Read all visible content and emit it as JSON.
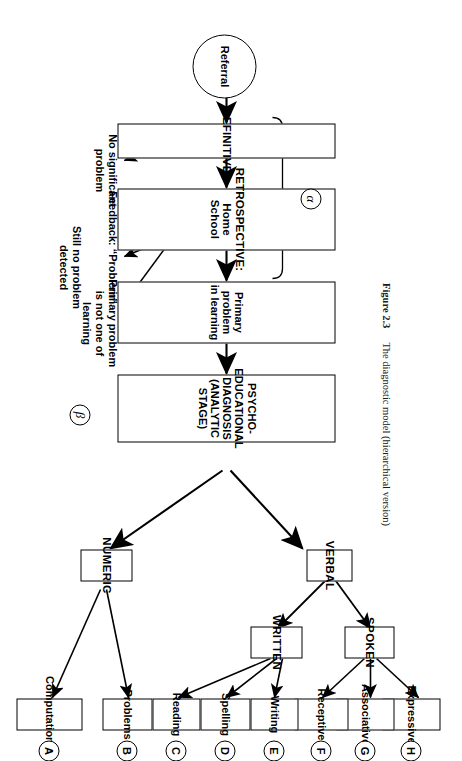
{
  "figure": {
    "caption_label": "Figure 2.3",
    "caption_text": "The diagnostic model (hierarchical version)"
  },
  "start": {
    "label": "Referral"
  },
  "stages": {
    "alpha_marker": "α",
    "beta_marker": "β",
    "boxes": [
      {
        "id": "definitive",
        "label": "DEFINITIVE"
      },
      {
        "id": "retrospective",
        "label": "RETROSPECTIVE: Home\nSchool"
      },
      {
        "id": "primary-problem",
        "label": "Primary problem\nin learning"
      },
      {
        "id": "psycho-educational",
        "label": "PSYCHO-EDUCATIONAL\nDIAGNOSIS (ANALYTIC STAGE)"
      }
    ]
  },
  "notes": [
    {
      "id": "no-significant-problem",
      "text": "No significant\nproblem"
    },
    {
      "id": "feedback-problem",
      "text": "Feedback: “Problem”"
    },
    {
      "id": "still-no-problem-detected",
      "text": "Still no problem\ndetected"
    },
    {
      "id": "primary-problem-not-learning",
      "text": "Primary problem\nis not one of\nlearning"
    }
  ],
  "branches": {
    "numeric": "NUMERIC",
    "verbal": "VERBAL",
    "written": "WRITTEN",
    "spoken": "SPOKEN"
  },
  "leaves": [
    {
      "key": "A",
      "label": "Computational",
      "parent": "NUMERIC"
    },
    {
      "key": "B",
      "label": "Problems",
      "parent": "NUMERIC"
    },
    {
      "key": "C",
      "label": "Reading",
      "parent": "WRITTEN"
    },
    {
      "key": "D",
      "label": "Spelling",
      "parent": "WRITTEN"
    },
    {
      "key": "E",
      "label": "Writing",
      "parent": "WRITTEN"
    },
    {
      "key": "F",
      "label": "Receptive",
      "parent": "SPOKEN"
    },
    {
      "key": "G",
      "label": "Associative",
      "parent": "SPOKEN"
    },
    {
      "key": "H",
      "label": "Expressive",
      "parent": "SPOKEN"
    }
  ],
  "colors": {
    "ink": "#000000",
    "paper": "#ffffff",
    "caption_ink": "#1a1a1a"
  }
}
